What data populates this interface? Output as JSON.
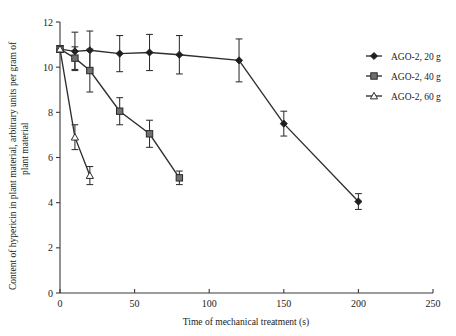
{
  "chart_data": {
    "type": "line",
    "title": "",
    "xlabel": "Time of mechanical treatment (s)",
    "ylabel": "Content of hypericin in plant material, arbitrary units per gram of plant material",
    "xlim": [
      0,
      250
    ],
    "ylim": [
      0,
      12
    ],
    "xticks": [
      0,
      50,
      100,
      150,
      200,
      250
    ],
    "yticks": [
      0,
      2,
      4,
      6,
      8,
      10,
      12
    ],
    "grid": false,
    "legend_position": "right",
    "series": [
      {
        "name": "AGO-2, 20 g",
        "marker": "filled-diamond",
        "color": "#1e1e1e",
        "x": [
          0,
          10,
          20,
          40,
          60,
          80,
          120,
          150,
          200
        ],
        "values": [
          10.8,
          10.7,
          10.75,
          10.6,
          10.65,
          10.55,
          10.3,
          7.5,
          4.05
        ],
        "errors": [
          0.15,
          0.85,
          0.85,
          0.8,
          0.8,
          0.85,
          0.95,
          0.55,
          0.35
        ]
      },
      {
        "name": "AGO-2, 40 g",
        "marker": "filled-square",
        "color": "#707070",
        "x": [
          0,
          10,
          20,
          40,
          60,
          80
        ],
        "values": [
          10.8,
          10.4,
          9.85,
          8.05,
          7.05,
          5.1
        ],
        "errors": [
          0.15,
          0.5,
          0.95,
          0.6,
          0.6,
          0.3
        ]
      },
      {
        "name": "AGO-2, 60 g",
        "marker": "open-triangle",
        "color": "#ffffff",
        "x": [
          0,
          10,
          20
        ],
        "values": [
          10.8,
          6.9,
          5.2
        ],
        "errors": [
          0.15,
          0.55,
          0.4
        ]
      }
    ]
  },
  "legend": {
    "items": [
      {
        "label": "AGO-2, 20 g",
        "marker": "filled-diamond"
      },
      {
        "label": "AGO-2, 40 g",
        "marker": "filled-square"
      },
      {
        "label": "AGO-2, 60 g",
        "marker": "open-triangle"
      }
    ]
  },
  "axes": {
    "x_title": "Time of mechanical treatment (s)",
    "y_title_line1": "Content of hypericin in plant material, arbitrary units per gram of",
    "y_title_line2": "plant material",
    "x_tick_labels": [
      "0",
      "50",
      "100",
      "150",
      "200",
      "250"
    ],
    "y_tick_labels": [
      "0",
      "2",
      "4",
      "6",
      "8",
      "10",
      "12"
    ]
  }
}
